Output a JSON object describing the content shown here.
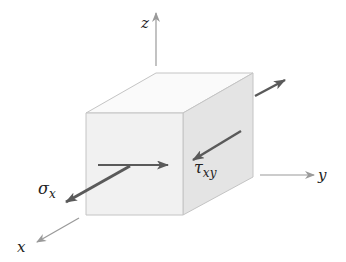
{
  "diagram": {
    "axes": {
      "x_label": "x",
      "y_label": "y",
      "z_label": "z"
    },
    "stresses": {
      "normal": {
        "symbol": "σ",
        "subscript": "x"
      },
      "shear": {
        "symbol": "τ",
        "subscript": "xy"
      }
    },
    "colors": {
      "axis": "#9a9a9a",
      "arrow": "#5a5a5a",
      "cube_edge": "#c4c4c4",
      "front_face": "#f1f1f1",
      "top_face": "#fafafa",
      "right_face": "#e4e4e4"
    }
  }
}
